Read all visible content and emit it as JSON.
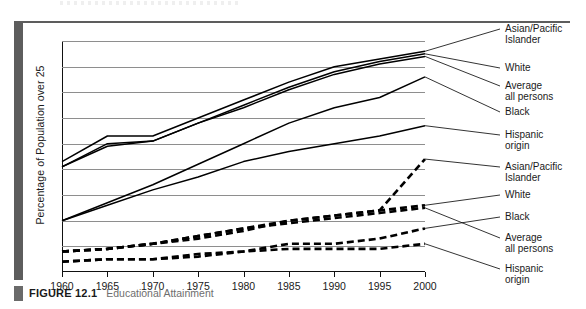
{
  "figure": {
    "label": "FIGURE 12.1",
    "title": "Educational Attainment"
  },
  "chart_data": {
    "type": "line",
    "title": "Educational Attainment",
    "xlabel": "",
    "ylabel": "Percentage of Population over 25",
    "x": [
      1960,
      1965,
      1970,
      1975,
      1980,
      1985,
      1990,
      1995,
      2000
    ],
    "xticklabels": [
      "1960",
      "1965",
      "1970",
      "1975",
      "1980",
      "1985",
      "1990",
      "1995",
      "2000"
    ],
    "xlim": [
      1960,
      2000
    ],
    "ylim": [
      0,
      90
    ],
    "yticks": [
      0,
      10,
      20,
      30,
      40,
      50,
      60,
      70,
      80,
      90
    ],
    "yticklabels": [
      "0",
      "10",
      "20",
      "30",
      "40",
      "50",
      "60",
      "70",
      "80",
      "90"
    ],
    "grid": "horizontal",
    "legend_position": "right-of-plot-with-leader-lines",
    "series": [
      {
        "name": "Asian/Pacific Islander",
        "style": "solid",
        "group": "high-school",
        "values": [
          43,
          53,
          53,
          60,
          67,
          74,
          80,
          83,
          86
        ]
      },
      {
        "name": "White",
        "style": "solid",
        "group": "high-school",
        "values": [
          41,
          50,
          51,
          58,
          65,
          72,
          78,
          82,
          85
        ]
      },
      {
        "name": "Average all persons",
        "style": "solid",
        "group": "high-school",
        "values": [
          41,
          49,
          51,
          58,
          64,
          71,
          77,
          81,
          84
        ]
      },
      {
        "name": "Black",
        "style": "solid",
        "group": "high-school",
        "values": [
          20,
          27,
          34,
          42,
          50,
          58,
          64,
          68,
          76
        ]
      },
      {
        "name": "Hispanic origin",
        "style": "solid",
        "group": "high-school",
        "values": [
          20,
          26,
          32,
          37,
          43,
          47,
          50,
          53,
          57
        ]
      },
      {
        "name": "Asian/Pacific Islander",
        "style": "dashed",
        "group": "college",
        "values": [
          8,
          9,
          11,
          13,
          16,
          20,
          22,
          24,
          44
        ]
      },
      {
        "name": "White",
        "style": "dashed",
        "group": "college",
        "values": [
          8,
          9,
          11,
          14,
          17,
          20,
          22,
          24,
          26
        ]
      },
      {
        "name": "Black",
        "style": "dashed",
        "group": "college",
        "values": [
          4,
          5,
          5,
          7,
          8,
          11,
          11,
          13,
          17
        ]
      },
      {
        "name": "Average all persons",
        "style": "dashed",
        "group": "college",
        "values": [
          8,
          9,
          11,
          14,
          17,
          19,
          21,
          23,
          25
        ]
      },
      {
        "name": "Hispanic origin",
        "style": "dashed",
        "group": "college",
        "values": [
          4,
          5,
          5,
          6,
          8,
          9,
          9,
          9,
          11
        ]
      }
    ],
    "legend_entries": [
      {
        "label": "Asian/Pacific\nIslander",
        "style": "solid"
      },
      {
        "label": "White",
        "style": "solid"
      },
      {
        "label": "Average\nall persons",
        "style": "solid"
      },
      {
        "label": "Black",
        "style": "solid"
      },
      {
        "label": "Hispanic\norigin",
        "style": "solid"
      },
      {
        "label": "Asian/Pacific\nIslander",
        "style": "dashed"
      },
      {
        "label": "White",
        "style": "dashed"
      },
      {
        "label": "Black",
        "style": "dashed"
      },
      {
        "label": "Average\nall persons",
        "style": "dashed"
      },
      {
        "label": "Hispanic\norigin",
        "style": "dashed"
      }
    ]
  }
}
